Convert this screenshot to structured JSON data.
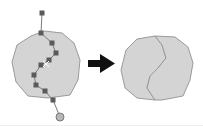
{
  "diagram": {
    "colors": {
      "polygon_fill": "#d4d4d4",
      "polygon_stroke": "#9a9a9a",
      "line_stroke": "#7a7a7a",
      "vertex_marker": "#5a5a5a",
      "end_marker": "#b8b8b8",
      "arrow": "#111111"
    },
    "before": {
      "label": "polygon-with-split-line",
      "polygon_points": "31,36 44,31 62,33 74,43 80,60 78,80 70,95 48,98 28,96 16,82 12,62 17,45",
      "split_line_points": "42,13 41,33 52,43 56,53 49,60 41,65 34,75 36,85 45,91 53,100 60,117",
      "vertices": [
        {
          "x": 42,
          "y": 13
        },
        {
          "x": 41,
          "y": 33
        },
        {
          "x": 52,
          "y": 43
        },
        {
          "x": 56,
          "y": 53
        },
        {
          "x": 49,
          "y": 60
        },
        {
          "x": 41,
          "y": 65
        },
        {
          "x": 34,
          "y": 75
        },
        {
          "x": 36,
          "y": 85
        },
        {
          "x": 45,
          "y": 91
        },
        {
          "x": 53,
          "y": 100
        }
      ],
      "cursor": {
        "x": 46,
        "y": 64
      },
      "end_point": {
        "x": 60,
        "y": 117
      }
    },
    "arrow": {
      "direction": "right"
    },
    "after": {
      "label": "split-polygons",
      "left_part_points": "137,39 155,36 162,45 166,58 158,68 150,76 147,88 155,100 137,98 125,88 121,70 126,50",
      "right_part_points": "155,36 175,37 188,47 193,63 190,80 183,96 162,100 155,100 147,88 150,76 158,68 166,58 162,45"
    }
  }
}
